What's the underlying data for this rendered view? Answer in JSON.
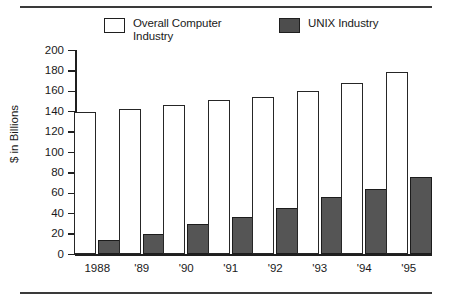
{
  "chart_data": {
    "type": "bar",
    "title": "",
    "subtitle": "",
    "xlabel": "",
    "ylabel": "$ in Billions",
    "ylim": [
      0,
      200
    ],
    "ytick_step": 20,
    "yticks": [
      0,
      20,
      40,
      60,
      80,
      100,
      120,
      140,
      160,
      180,
      200
    ],
    "ytick_labels": [
      "0",
      "20",
      "40",
      "60",
      "80",
      "100",
      "120",
      "140",
      "160",
      "180",
      "200"
    ],
    "categories": [
      "1988",
      "'89",
      "'90",
      "'91",
      "'92",
      "'93",
      "'94",
      "'95"
    ],
    "grid": false,
    "legend_position": "top",
    "series": [
      {
        "name": "Overall Computer\nIndustry",
        "legend_label": "Overall Computer\nIndustry",
        "swatch": "hollow",
        "color": "#ffffff",
        "edge_color": "#262626",
        "values": [
          140,
          143,
          147,
          151,
          154,
          160,
          168,
          179
        ]
      },
      {
        "name": "UNIX Industry",
        "legend_label": "UNIX Industry",
        "swatch": "filled",
        "color": "#555555",
        "edge_color": "#1c1c1c",
        "values": [
          14,
          20,
          30,
          37,
          46,
          56,
          64,
          76
        ]
      }
    ]
  },
  "figure": {
    "rule_color": "#3a3a3a",
    "background": "#ffffff",
    "axis_color": "#1f1f1f"
  }
}
